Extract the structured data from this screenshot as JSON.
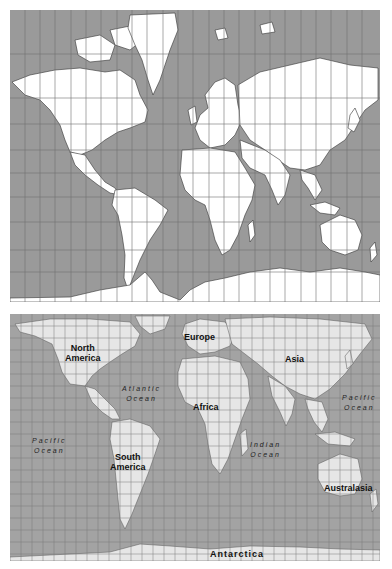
{
  "figure": {
    "top_map": {
      "projection": "Mercator",
      "colors": {
        "ocean": "#9a9a9a",
        "land": "#ffffff",
        "grid": "#6e6e6e",
        "borders": "#222222"
      }
    },
    "bottom_map": {
      "projection": "Gall-Peters",
      "colors": {
        "ocean": "#a3a3a3",
        "land": "#e6e6e6",
        "grid": "#7a7a7a",
        "borders": "#555555"
      },
      "continent_labels": {
        "north_america": "North\nAmerica",
        "europe": "Europe",
        "asia": "Asia",
        "africa": "Africa",
        "south_america": "South\nAmerica",
        "australasia": "Australasia",
        "antarctica": "Antarctica"
      },
      "ocean_labels": {
        "atlantic": "Atlantic\nOcean",
        "pacific_west": "Pacific\nOcean",
        "pacific_east": "Pacific\nOcean",
        "indian": "Indian\nOcean"
      }
    }
  }
}
